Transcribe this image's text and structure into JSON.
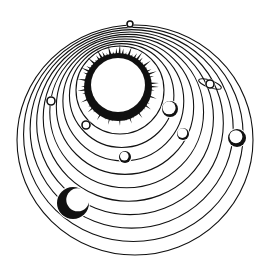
{
  "colors": {
    "ink": "#111111",
    "paper": "#ffffff"
  },
  "sun": {
    "cx": 118,
    "cy": 85,
    "r": 27,
    "corona_inner": 28,
    "corona_outer": 41,
    "rays": 64
  },
  "orbits": {
    "count": 10,
    "inner": {
      "cx": 120,
      "cy": 90,
      "rx": 44,
      "ry": 44
    },
    "outer": {
      "cx": 135,
      "cy": 140,
      "rx": 118,
      "ry": 115
    }
  },
  "planets": [
    {
      "name": "tiny-inner-planet",
      "cx": 86,
      "cy": 125,
      "r": 4,
      "shade": "none"
    },
    {
      "name": "left-small-planet",
      "cx": 51,
      "cy": 101,
      "r": 4,
      "shade": "none"
    },
    {
      "name": "medium-planet-right",
      "cx": 170,
      "cy": 109,
      "r": 8,
      "shade": "light"
    },
    {
      "name": "small-planet-right",
      "cx": 183,
      "cy": 134,
      "r": 6,
      "shade": "light"
    },
    {
      "name": "planet-lower-center",
      "cx": 125,
      "cy": 157,
      "r": 6,
      "shade": "dark"
    },
    {
      "name": "ringed-planet",
      "cx": 210,
      "cy": 84,
      "r": 4,
      "shade": "none",
      "ring": true
    },
    {
      "name": "planet-far-right",
      "cx": 237,
      "cy": 138,
      "r": 9,
      "shade": "dark"
    },
    {
      "name": "large-planet",
      "cx": 73,
      "cy": 203,
      "r": 16,
      "shade": "crescent"
    },
    {
      "name": "top-outer-planet",
      "cx": 130,
      "cy": 24,
      "r": 3,
      "shade": "none"
    }
  ]
}
